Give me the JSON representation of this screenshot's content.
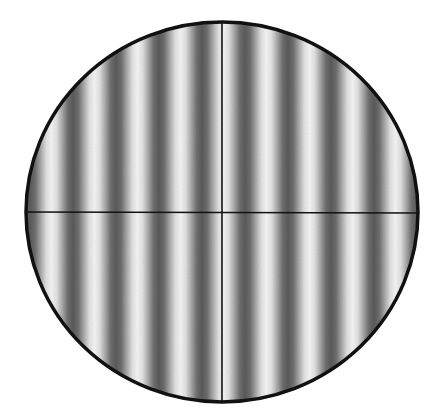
{
  "diagram": {
    "type": "interference-fringe-field",
    "canvas": {
      "width": 445,
      "height": 417
    },
    "background_color": "#ffffff",
    "field_of_view": {
      "shape": "ellipse",
      "center_x": 222,
      "center_y": 212,
      "radius_x": 196,
      "radius_y": 190,
      "border_color": "#111111",
      "border_width": 3.5
    },
    "fringes": {
      "orientation": "vertical",
      "count_dark": 10,
      "period_px": 43,
      "first_dark_center_x": 30,
      "dark_centers_x": [
        30,
        73,
        117,
        158,
        202,
        245,
        287,
        331,
        373,
        416
      ],
      "dark_color": "#5a5a5a",
      "light_color": "#f4f4f4",
      "profile": "sinusoidal"
    },
    "crosshair": {
      "vertical_line_x": 222,
      "horizontal_line_y": 212,
      "color": "#111111",
      "width": 1.6
    }
  }
}
